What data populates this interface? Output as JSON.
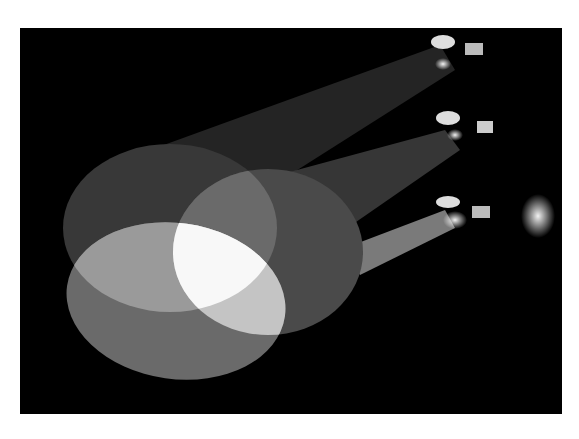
{
  "image": {
    "subject": "three stage spotlights projecting overlapping beams onto a dark surface",
    "style": "grayscale photograph",
    "colors": {
      "background": "#ffffff",
      "frame": "#000000",
      "beam_dim": "#3a3a3a",
      "beam_mid": "#6e6e6e",
      "beam_bright": "#a8a8a8",
      "overlap_core": "#f7f7f7"
    },
    "spotlights": [
      {
        "id": "top",
        "label": "spotlight-top"
      },
      {
        "id": "middle",
        "label": "spotlight-middle"
      },
      {
        "id": "bottom",
        "label": "spotlight-bottom"
      }
    ]
  }
}
